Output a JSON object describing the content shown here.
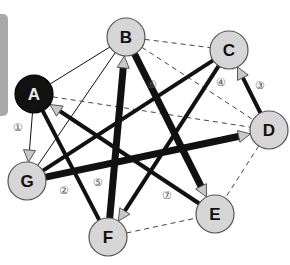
{
  "diagram": {
    "type": "directed-graph",
    "colors": {
      "node_fill": "#d6d6d6",
      "node_stroke": "#555555",
      "highlight_node_fill": "#111111",
      "edge": "#111111",
      "arrowhead_fill": "#c8c8c8",
      "side_tab": "#a9a9a9"
    },
    "nodes": [
      {
        "id": "A",
        "label": "A",
        "x": 34,
        "y": 94,
        "highlight": true
      },
      {
        "id": "B",
        "label": "B",
        "x": 126,
        "y": 37,
        "highlight": false
      },
      {
        "id": "C",
        "label": "C",
        "x": 229,
        "y": 50,
        "highlight": false
      },
      {
        "id": "D",
        "label": "D",
        "x": 269,
        "y": 130,
        "highlight": false
      },
      {
        "id": "E",
        "label": "E",
        "x": 215,
        "y": 214,
        "highlight": false
      },
      {
        "id": "F",
        "label": "F",
        "x": 108,
        "y": 237,
        "highlight": false
      },
      {
        "id": "G",
        "label": "G",
        "x": 27,
        "y": 181,
        "highlight": false
      }
    ],
    "edges": [
      {
        "from": "A",
        "to": "B",
        "style": "thin",
        "arrow": false
      },
      {
        "from": "G",
        "to": "B",
        "style": "thin",
        "arrow": false
      },
      {
        "from": "A",
        "to": "G",
        "style": "thin",
        "arrow": true
      },
      {
        "from": "A",
        "to": "D",
        "style": "dashed",
        "arrow": false
      },
      {
        "from": "B",
        "to": "C",
        "style": "dashed",
        "arrow": false
      },
      {
        "from": "B",
        "to": "D",
        "style": "dashed",
        "arrow": false
      },
      {
        "from": "D",
        "to": "E",
        "style": "dashed",
        "arrow": false
      },
      {
        "from": "F",
        "to": "E",
        "style": "dashed",
        "arrow": false
      },
      {
        "from": "A",
        "to": "F",
        "style": "thick",
        "arrow": false
      },
      {
        "from": "E",
        "to": "A",
        "style": "thick",
        "arrow": true
      },
      {
        "from": "G",
        "to": "C",
        "style": "thick",
        "arrow": false
      },
      {
        "from": "G",
        "to": "D",
        "style": "heavy",
        "arrow": true
      },
      {
        "from": "F",
        "to": "B",
        "style": "heavy",
        "arrow": true
      },
      {
        "from": "B",
        "to": "E",
        "style": "heavy",
        "arrow": true
      },
      {
        "from": "C",
        "to": "F",
        "style": "thick",
        "arrow": true
      },
      {
        "from": "D",
        "to": "C",
        "style": "thick",
        "arrow": true
      }
    ],
    "edge_labels": [
      {
        "text": "①",
        "x": 18,
        "y": 131
      },
      {
        "text": "②",
        "x": 64,
        "y": 194
      },
      {
        "text": "③",
        "x": 260,
        "y": 89
      },
      {
        "text": "④",
        "x": 221,
        "y": 86
      },
      {
        "text": "⑤",
        "x": 98,
        "y": 186
      },
      {
        "text": "⑥",
        "x": 152,
        "y": 88
      },
      {
        "text": "⑦",
        "x": 167,
        "y": 199
      }
    ]
  }
}
